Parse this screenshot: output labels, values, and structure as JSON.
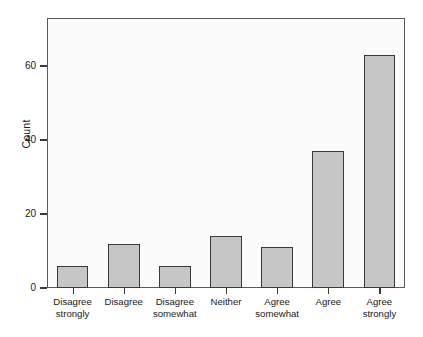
{
  "chart_data": {
    "type": "bar",
    "title": "",
    "subtitle": "",
    "xlabel": "",
    "ylabel": "Count",
    "categories": [
      "Disagree strongly",
      "Disagree",
      "Disagree somewhat",
      "Neither",
      "Agree somewhat",
      "Agree",
      "Agree strongly"
    ],
    "category_lines": [
      [
        "Disagree",
        "strongly"
      ],
      [
        "Disagree",
        ""
      ],
      [
        "Disagree",
        "somewhat"
      ],
      [
        "Neither",
        ""
      ],
      [
        "Agree",
        "somewhat"
      ],
      [
        "Agree",
        ""
      ],
      [
        "Agree",
        "strongly"
      ]
    ],
    "values": [
      6,
      12,
      6,
      14,
      11,
      37,
      63
    ],
    "ylim": [
      0,
      73
    ],
    "yticks": [
      0,
      20,
      40,
      60
    ],
    "ytick_labels": [
      "0",
      "20",
      "40",
      "60"
    ],
    "grid": false,
    "legend": null,
    "bar_fill_color": "#c6c6c6",
    "bar_border_color": "#3a3a3a",
    "axis_color": "#3a3a3a",
    "plot_background": "#fbfbfb",
    "figure_background": "#ffffff"
  }
}
